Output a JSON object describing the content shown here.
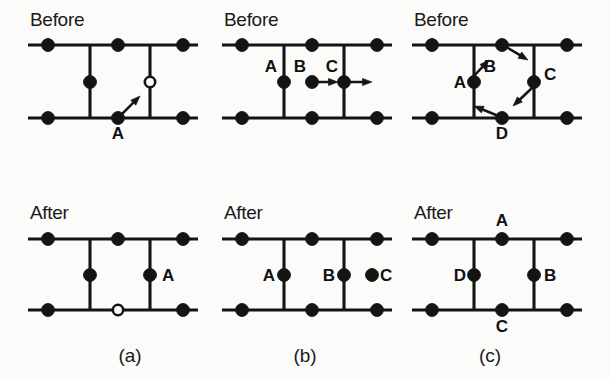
{
  "figure": {
    "background_color": "#fbfbf9",
    "ink_color": "#141414",
    "width": 610,
    "height": 380,
    "stage_before_label": "Before",
    "stage_after_label": "After"
  },
  "geometry": {
    "row_before": {
      "top_rail_y": 45,
      "bottom_rail_y": 118,
      "mid_y": 82
    },
    "row_after": {
      "top_rail_y": 239,
      "bottom_rail_y": 310,
      "mid_y": 275
    },
    "columns": [
      {
        "id": "a",
        "rail_x1": 28,
        "rail_x2": 198,
        "node_left_x": 48,
        "vert_left_x": 90,
        "node_mid_x": 118,
        "vert_right_x": 150,
        "node_right_x": 183
      },
      {
        "id": "b",
        "rail_x1": 222,
        "rail_x2": 392,
        "node_left_x": 242,
        "vert_left_x": 284,
        "node_mid_x": 312,
        "vert_right_x": 344,
        "node_right_x": 377
      },
      {
        "id": "c",
        "rail_x1": 412,
        "rail_x2": 582,
        "node_left_x": 432,
        "vert_left_x": 474,
        "node_mid_x": 502,
        "vert_right_x": 534,
        "node_right_x": 567
      }
    ],
    "atom_radius": 6.4,
    "vacancy_radius": 5.2,
    "stage_label_positions": {
      "before_y": 26,
      "after_y": 219,
      "x_offsets": [
        30,
        224,
        414
      ]
    },
    "caption_y": 362
  },
  "panels": [
    {
      "id": "a",
      "caption": "(a)",
      "caption_x": 130,
      "before": {
        "stage": "Before",
        "atoms": [
          {
            "name": "rail-node-top-left",
            "x": 48,
            "y": 45,
            "kind": "filled"
          },
          {
            "name": "rail-node-top-mid",
            "x": 118,
            "y": 45,
            "kind": "filled"
          },
          {
            "name": "rail-node-top-right",
            "x": 183,
            "y": 45,
            "kind": "filled"
          },
          {
            "name": "rail-node-bottom-left",
            "x": 48,
            "y": 118,
            "kind": "filled"
          },
          {
            "name": "rail-node-bottom-right",
            "x": 183,
            "y": 118,
            "kind": "filled"
          },
          {
            "name": "interstitial-left",
            "x": 90,
            "y": 82,
            "kind": "filled"
          },
          {
            "name": "vacancy-right",
            "x": 150,
            "y": 82,
            "kind": "open"
          },
          {
            "name": "atom-A",
            "x": 118,
            "y": 118,
            "kind": "filled"
          }
        ],
        "labels": [
          {
            "text": "A",
            "x": 118,
            "y": 139,
            "anchor": "middle"
          }
        ],
        "arrows": [
          {
            "name": "arrow-A-up-right",
            "x1": 120,
            "y1": 116,
            "x2": 140,
            "y2": 96
          }
        ]
      },
      "after": {
        "stage": "After",
        "atoms": [
          {
            "name": "rail-node-top-left",
            "x": 48,
            "y": 239,
            "kind": "filled"
          },
          {
            "name": "rail-node-top-mid",
            "x": 118,
            "y": 239,
            "kind": "filled"
          },
          {
            "name": "rail-node-top-right",
            "x": 183,
            "y": 239,
            "kind": "filled"
          },
          {
            "name": "rail-node-bottom-left",
            "x": 48,
            "y": 310,
            "kind": "filled"
          },
          {
            "name": "rail-node-bottom-right",
            "x": 183,
            "y": 310,
            "kind": "filled"
          },
          {
            "name": "interstitial-left",
            "x": 90,
            "y": 275,
            "kind": "filled"
          },
          {
            "name": "atom-A",
            "x": 150,
            "y": 275,
            "kind": "filled"
          },
          {
            "name": "vacancy-bottom-mid",
            "x": 118,
            "y": 310,
            "kind": "open"
          }
        ],
        "labels": [
          {
            "text": "A",
            "x": 162,
            "y": 281,
            "anchor": "start"
          }
        ],
        "arrows": []
      }
    },
    {
      "id": "b",
      "caption": "(b)",
      "caption_x": 305,
      "before": {
        "stage": "Before",
        "atoms": [
          {
            "name": "rail-node-top-left",
            "x": 242,
            "y": 45,
            "kind": "filled"
          },
          {
            "name": "rail-node-top-mid",
            "x": 312,
            "y": 45,
            "kind": "filled"
          },
          {
            "name": "rail-node-top-right",
            "x": 377,
            "y": 45,
            "kind": "filled"
          },
          {
            "name": "rail-node-bottom-left",
            "x": 242,
            "y": 118,
            "kind": "filled"
          },
          {
            "name": "rail-node-bottom-mid",
            "x": 312,
            "y": 118,
            "kind": "filled"
          },
          {
            "name": "rail-node-bottom-right",
            "x": 377,
            "y": 118,
            "kind": "filled"
          },
          {
            "name": "atom-A",
            "x": 284,
            "y": 82,
            "kind": "filled"
          },
          {
            "name": "atom-B",
            "x": 312,
            "y": 82,
            "kind": "filled"
          },
          {
            "name": "atom-C",
            "x": 344,
            "y": 82,
            "kind": "filled"
          }
        ],
        "labels": [
          {
            "text": "A",
            "x": 277,
            "y": 72,
            "anchor": "end"
          },
          {
            "text": "B",
            "x": 306,
            "y": 72,
            "anchor": "end"
          },
          {
            "text": "C",
            "x": 338,
            "y": 72,
            "anchor": "end"
          }
        ],
        "arrows": [
          {
            "name": "arrow-B-right",
            "x1": 317,
            "y1": 82,
            "x2": 338,
            "y2": 82
          },
          {
            "name": "arrow-C-right",
            "x1": 349,
            "y1": 82,
            "x2": 372,
            "y2": 82
          }
        ]
      },
      "after": {
        "stage": "After",
        "atoms": [
          {
            "name": "rail-node-top-left",
            "x": 242,
            "y": 239,
            "kind": "filled"
          },
          {
            "name": "rail-node-top-mid",
            "x": 312,
            "y": 239,
            "kind": "filled"
          },
          {
            "name": "rail-node-top-right",
            "x": 377,
            "y": 239,
            "kind": "filled"
          },
          {
            "name": "rail-node-bottom-left",
            "x": 242,
            "y": 310,
            "kind": "filled"
          },
          {
            "name": "rail-node-bottom-mid",
            "x": 312,
            "y": 310,
            "kind": "filled"
          },
          {
            "name": "rail-node-bottom-right",
            "x": 377,
            "y": 310,
            "kind": "filled"
          },
          {
            "name": "atom-A",
            "x": 284,
            "y": 275,
            "kind": "filled"
          },
          {
            "name": "atom-B",
            "x": 344,
            "y": 275,
            "kind": "filled"
          },
          {
            "name": "atom-C",
            "x": 372,
            "y": 275,
            "kind": "filled"
          }
        ],
        "labels": [
          {
            "text": "A",
            "x": 275,
            "y": 281,
            "anchor": "end"
          },
          {
            "text": "B",
            "x": 335,
            "y": 281,
            "anchor": "end"
          },
          {
            "text": "C",
            "x": 380,
            "y": 281,
            "anchor": "start"
          }
        ],
        "arrows": []
      }
    },
    {
      "id": "c",
      "caption": "(c)",
      "caption_x": 490,
      "before": {
        "stage": "Before",
        "atoms": [
          {
            "name": "rail-node-top-left",
            "x": 432,
            "y": 45,
            "kind": "filled"
          },
          {
            "name": "atom-B",
            "x": 502,
            "y": 45,
            "kind": "filled"
          },
          {
            "name": "rail-node-top-right",
            "x": 567,
            "y": 45,
            "kind": "filled"
          },
          {
            "name": "rail-node-bottom-left",
            "x": 432,
            "y": 118,
            "kind": "filled"
          },
          {
            "name": "atom-D",
            "x": 502,
            "y": 118,
            "kind": "filled"
          },
          {
            "name": "rail-node-bottom-right",
            "x": 567,
            "y": 118,
            "kind": "filled"
          },
          {
            "name": "atom-A",
            "x": 474,
            "y": 82,
            "kind": "filled"
          },
          {
            "name": "atom-C",
            "x": 534,
            "y": 82,
            "kind": "filled"
          }
        ],
        "labels": [
          {
            "text": "A",
            "x": 466,
            "y": 88,
            "anchor": "end"
          },
          {
            "text": "B",
            "x": 496,
            "y": 72,
            "anchor": "end"
          },
          {
            "text": "C",
            "x": 544,
            "y": 80,
            "anchor": "start"
          },
          {
            "text": "D",
            "x": 502,
            "y": 139,
            "anchor": "middle"
          }
        ],
        "arrows": [
          {
            "name": "arrow-A-up-right",
            "x1": 472,
            "y1": 78,
            "x2": 489,
            "y2": 60
          },
          {
            "name": "arrow-B-down-right",
            "x1": 508,
            "y1": 48,
            "x2": 528,
            "y2": 60
          },
          {
            "name": "arrow-C-down-left",
            "x1": 532,
            "y1": 88,
            "x2": 513,
            "y2": 106
          },
          {
            "name": "arrow-D-up-left",
            "x1": 496,
            "y1": 115,
            "x2": 474,
            "y2": 106
          }
        ]
      },
      "after": {
        "stage": "After",
        "atoms": [
          {
            "name": "rail-node-top-left",
            "x": 432,
            "y": 239,
            "kind": "filled"
          },
          {
            "name": "atom-A",
            "x": 502,
            "y": 239,
            "kind": "filled"
          },
          {
            "name": "rail-node-top-right",
            "x": 567,
            "y": 239,
            "kind": "filled"
          },
          {
            "name": "rail-node-bottom-left",
            "x": 432,
            "y": 310,
            "kind": "filled"
          },
          {
            "name": "atom-C",
            "x": 502,
            "y": 310,
            "kind": "filled"
          },
          {
            "name": "rail-node-bottom-right",
            "x": 567,
            "y": 310,
            "kind": "filled"
          },
          {
            "name": "atom-D",
            "x": 474,
            "y": 275,
            "kind": "filled"
          },
          {
            "name": "atom-B",
            "x": 534,
            "y": 275,
            "kind": "filled"
          }
        ],
        "labels": [
          {
            "text": "A",
            "x": 502,
            "y": 226,
            "anchor": "middle"
          },
          {
            "text": "D",
            "x": 466,
            "y": 281,
            "anchor": "end"
          },
          {
            "text": "B",
            "x": 544,
            "y": 281,
            "anchor": "start"
          },
          {
            "text": "C",
            "x": 502,
            "y": 332,
            "anchor": "middle"
          }
        ],
        "arrows": []
      }
    }
  ]
}
